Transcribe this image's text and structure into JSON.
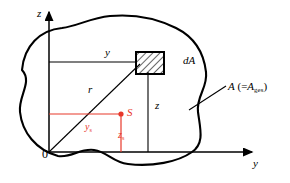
{
  "figure": {
    "width": 290,
    "height": 183,
    "background": "#ffffff",
    "line_color": "#000000",
    "accent_color": "#e8382a"
  },
  "axes": {
    "vertical": {
      "name": "z-axis",
      "label": "z"
    },
    "horizontal": {
      "name": "y-axis",
      "label": "y"
    },
    "origin": {
      "label": "0"
    }
  },
  "labels": {
    "y_dimension": "y",
    "z_dimension": "z",
    "radius": "r",
    "element": "dA",
    "centroid": "S",
    "centroid_y": {
      "base": "y",
      "sub": "s"
    },
    "centroid_z": {
      "base": "z",
      "sub": "s"
    },
    "area": {
      "base": "A",
      "prefix": "(=",
      "sub_base": "A",
      "sub": "ges",
      "suffix": ")"
    }
  },
  "elements": {
    "blob": {
      "name": "area-outline",
      "fill": "#ffffff",
      "stroke": "#000000",
      "stroke_width": 2
    },
    "hatched_square": {
      "name": "differential-area-element",
      "hatch": true,
      "stroke": "#000000"
    },
    "centroid_marker": {
      "name": "centroid-point",
      "color": "#e8382a",
      "radius": 2.5
    },
    "radius_line": {
      "name": "radius-vector",
      "from": "origin",
      "to": "dA"
    }
  }
}
